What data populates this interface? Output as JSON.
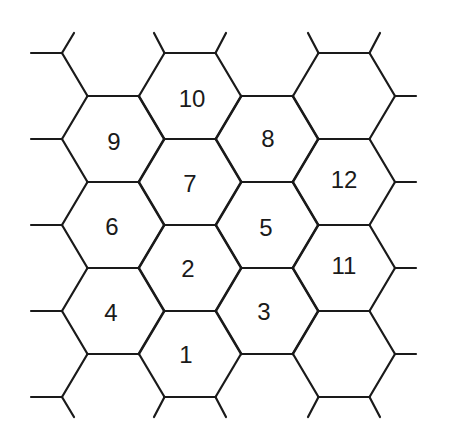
{
  "diagram": {
    "type": "hexagonal-grid",
    "stroke_color": "#1a1a1a",
    "background": "#ffffff",
    "cells": [
      {
        "label": "1",
        "cx": 190,
        "cy": 354
      },
      {
        "label": "2",
        "cx": 190,
        "cy": 268
      },
      {
        "label": "3",
        "cx": 267,
        "cy": 311
      },
      {
        "label": "4",
        "cx": 113,
        "cy": 311
      },
      {
        "label": "5",
        "cx": 267,
        "cy": 225
      },
      {
        "label": "6",
        "cx": 113,
        "cy": 225
      },
      {
        "label": "7",
        "cx": 190,
        "cy": 182
      },
      {
        "label": "8",
        "cx": 267,
        "cy": 139
      },
      {
        "label": "9",
        "cx": 113,
        "cy": 139
      },
      {
        "label": "10",
        "cx": 190,
        "cy": 96
      },
      {
        "label": "11",
        "cx": 344,
        "cy": 268
      },
      {
        "label": "12",
        "cx": 344,
        "cy": 182
      },
      {
        "label": "",
        "cx": 344,
        "cy": 96
      },
      {
        "label": "",
        "cx": 344,
        "cy": 354
      },
      {
        "label": "",
        "cx": 113,
        "cy": 397
      }
    ]
  }
}
